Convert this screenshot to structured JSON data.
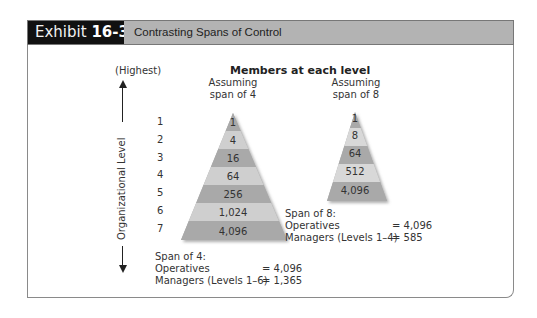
{
  "header": {
    "exhibit_label": "Exhibit",
    "exhibit_number": "16-3",
    "title": "Contrasting Spans of Control"
  },
  "diagram": {
    "members_title": "Members at each level",
    "axis": {
      "top_label": "(Highest)",
      "vertical_label": "Organizational Level",
      "levels": [
        "1",
        "2",
        "3",
        "4",
        "5",
        "6",
        "7"
      ]
    },
    "pyramid_span4": {
      "caption_line1": "Assuming",
      "caption_line2": "span of 4",
      "values": [
        "1",
        "4",
        "16",
        "64",
        "256",
        "1,024",
        "4,096"
      ],
      "summary_title": "Span of 4:",
      "operatives_label": "Operatives",
      "operatives_value": "= 4,096",
      "managers_label": "Managers (Levels 1–6)",
      "managers_value": "= 1,365"
    },
    "pyramid_span8": {
      "caption_line1": "Assuming",
      "caption_line2": "span of 8",
      "values": [
        "1",
        "8",
        "64",
        "512",
        "4,096"
      ],
      "summary_title": "Span of 8:",
      "operatives_label": "Operatives",
      "operatives_value": "= 4,096",
      "managers_label": "Managers (Levels 1–4)",
      "managers_value": "= 585"
    },
    "colors": {
      "band_dark": "#a9a9a9",
      "band_light": "#cfcfcf",
      "header_black": "#111111",
      "header_gray": "#b3b3b3"
    }
  }
}
